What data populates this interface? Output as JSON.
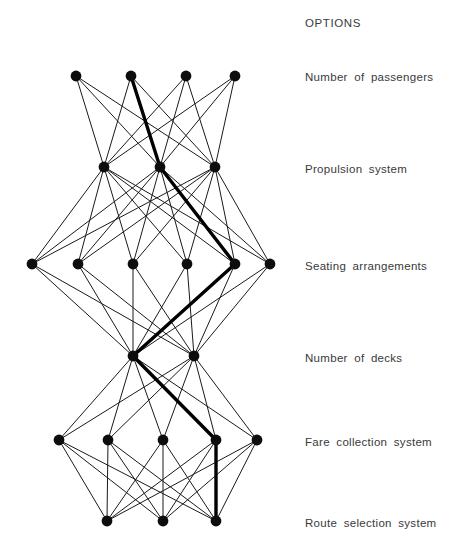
{
  "diagram": {
    "header": "OPTIONS",
    "geometry": {
      "width": 466,
      "height": 554,
      "node_radius": 5.4,
      "label_x": 305
    },
    "colors": {
      "node": "#0d0d0d",
      "edge": "#1a1a1a",
      "highlight": "#000000",
      "text": "#3a3a3a",
      "background": "#ffffff"
    },
    "rows": [
      {
        "id": "row-1",
        "label": "Number of passengers",
        "label_y": 71,
        "node_y": 76,
        "node_count": 4,
        "node_x": [
          76,
          131,
          186,
          235
        ],
        "selected_index": 1
      },
      {
        "id": "row-2",
        "label": "Propulsion  system",
        "label_y": 163,
        "node_y": 167,
        "node_count": 3,
        "node_x": [
          104,
          160,
          215
        ],
        "selected_index": 1
      },
      {
        "id": "row-3",
        "label": "Seating  arrangements",
        "label_y": 260,
        "node_y": 264,
        "node_count": 6,
        "node_x": [
          32,
          78,
          133,
          187,
          235,
          270
        ],
        "selected_index": 4
      },
      {
        "id": "row-4",
        "label": "Number of decks",
        "label_y": 352,
        "node_y": 356,
        "node_count": 2,
        "node_x": [
          133,
          194
        ],
        "selected_index": 0
      },
      {
        "id": "row-5",
        "label": "Fare  collection  system",
        "label_y": 436,
        "node_y": 440,
        "node_count": 5,
        "node_x": [
          59,
          108,
          163,
          216,
          257
        ],
        "selected_index": 3
      },
      {
        "id": "row-6",
        "label": "Route  selection  system",
        "label_y": 517,
        "node_y": 521,
        "node_count": 3,
        "node_x": [
          107,
          163,
          216
        ],
        "selected_index": 2
      }
    ],
    "edge_layers": [
      {
        "from_row": 0,
        "to_row": 1,
        "type": "complete-bipartite",
        "edge_count": 12
      },
      {
        "from_row": 1,
        "to_row": 2,
        "type": "complete-bipartite",
        "edge_count": 18
      },
      {
        "from_row": 2,
        "to_row": 3,
        "type": "complete-bipartite",
        "edge_count": 12
      },
      {
        "from_row": 3,
        "to_row": 4,
        "type": "complete-bipartite",
        "edge_count": 10
      },
      {
        "from_row": 4,
        "to_row": 5,
        "type": "complete-bipartite",
        "edge_count": 15
      }
    ],
    "selected_path": [
      {
        "row": 0,
        "index": 1
      },
      {
        "row": 1,
        "index": 1
      },
      {
        "row": 2,
        "index": 4
      },
      {
        "row": 3,
        "index": 0
      },
      {
        "row": 4,
        "index": 3
      },
      {
        "row": 5,
        "index": 2
      }
    ]
  }
}
